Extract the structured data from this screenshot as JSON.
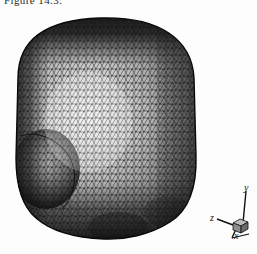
{
  "figure": {
    "caption_fragment": "Figure 14.3:",
    "background_color": "#fdfdfd",
    "render_style": "grayscale shaded triangular finite-element surface mesh",
    "object_description": "rounded cube / barrel-shaped solid body with concave dimple on lower-left face and bumpy lower contour",
    "mesh": {
      "element_type": "triangle",
      "edge_color": "#1d1d1d",
      "fill_light": "#efefef",
      "fill_mid": "#9a9a9a",
      "fill_dark": "#2a2a2a",
      "highlight_center_x": 88,
      "highlight_center_y": 118,
      "rows": 46,
      "columns": 52
    },
    "shading": {
      "light_source": "upper-left-front",
      "top_face_tone": "#3a3a3a",
      "left_edge_tone": "#101010",
      "right_edge_tone": "#6e6e6e",
      "bottom_edge_tone": "#181818"
    }
  },
  "axis_triad": {
    "name": "coordinate-axis-indicator",
    "origin_label": "",
    "cube_fill": "#8f8f8f",
    "cube_top_fill": "#b8b8b8",
    "cube_side_fill": "#6a6a6a",
    "line_color": "#111111",
    "axes": [
      {
        "id": "y",
        "label": "y",
        "direction": "up"
      },
      {
        "id": "z",
        "label": "z",
        "direction": "left"
      },
      {
        "id": "x",
        "label": "x",
        "direction": "down-right"
      }
    ]
  }
}
